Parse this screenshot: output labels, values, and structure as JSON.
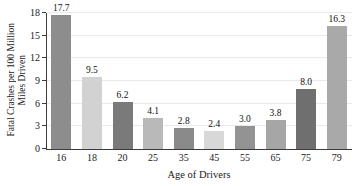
{
  "chart_data": {
    "type": "bar",
    "title": "",
    "xlabel": "Age of Drivers",
    "ylabel": "Fatal Crashes per 100 Million Miles Driven",
    "ylabel_line1": "Fatal Crashes per 100 Million",
    "ylabel_line2": "Miles Driven",
    "categories": [
      "16",
      "18",
      "20",
      "25",
      "35",
      "45",
      "55",
      "65",
      "75",
      "79"
    ],
    "values": [
      17.7,
      9.5,
      6.2,
      4.1,
      2.8,
      2.4,
      3.0,
      3.8,
      8.0,
      16.3
    ],
    "value_labels": [
      "17.7",
      "9.5",
      "6.2",
      "4.1",
      "2.8",
      "2.4",
      "3.0",
      "3.8",
      "8.0",
      "16.3"
    ],
    "bar_colors": [
      "#8d8d8d",
      "#d2d2d2",
      "#7a7a7a",
      "#b9b9b9",
      "#8a8a8a",
      "#d8d8d8",
      "#939393",
      "#a6a6a6",
      "#6f6f6f",
      "#a9a9a9"
    ],
    "ylim": [
      0,
      18
    ],
    "yticks": [
      0,
      3,
      6,
      9,
      12,
      15,
      18
    ],
    "ytick_labels": [
      "0",
      "3",
      "6",
      "9",
      "12",
      "15",
      "18"
    ],
    "grid": true,
    "grid_color": "#e9e9e9",
    "axis_color": "#3b3b3b",
    "legend": null,
    "background": "#ffffff"
  }
}
